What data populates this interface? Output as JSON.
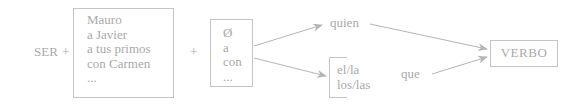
{
  "diagram": {
    "start": {
      "label": "SER",
      "plus": "+"
    },
    "group1": {
      "items": [
        "Mauro",
        "a Javier",
        "a tus primos",
        "con Carmen",
        "..."
      ],
      "plus": "+"
    },
    "group2": {
      "items": [
        "Ø",
        "a",
        "con",
        "..."
      ]
    },
    "branch_top": {
      "label": "quien"
    },
    "branch_bottom": {
      "items": [
        "el/la",
        "los/las"
      ],
      "connector": "que"
    },
    "end": {
      "label": "VERBO"
    },
    "colors": {
      "text": "#a9a9a9",
      "lines": "#c4c4c4",
      "arrows": "#b5b5b5"
    }
  }
}
